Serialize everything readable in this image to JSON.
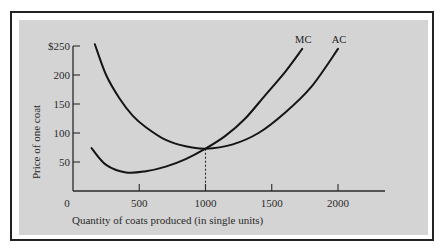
{
  "chart_data": {
    "type": "line",
    "title": "",
    "xlabel": "Quantity of coats produced (in single units)",
    "ylabel": "Price of one coat",
    "xlim": [
      0,
      2350
    ],
    "ylim": [
      0,
      250
    ],
    "x_ticks": [
      0,
      500,
      1000,
      1500,
      2000
    ],
    "x_tick_labels": [
      "0",
      "500",
      "1000",
      "1500",
      "2000"
    ],
    "y_ticks": [
      50,
      100,
      150,
      200,
      250
    ],
    "y_tick_labels": [
      "50",
      "100",
      "150",
      "200",
      "$250"
    ],
    "grid": false,
    "legend": "inline labels at curve ends",
    "series": [
      {
        "name": "MC",
        "x": [
          140,
          250,
          400,
          550,
          700,
          850,
          1000,
          1150,
          1300,
          1450,
          1600,
          1730
        ],
        "y": [
          74,
          45,
          32,
          34,
          42,
          55,
          73,
          95,
          125,
          165,
          205,
          245
        ]
      },
      {
        "name": "AC",
        "x": [
          165,
          250,
          350,
          450,
          550,
          700,
          850,
          1000,
          1200,
          1400,
          1600,
          1800,
          2000
        ],
        "y": [
          253,
          200,
          160,
          130,
          110,
          88,
          77,
          73,
          80,
          100,
          135,
          180,
          245
        ]
      }
    ],
    "annotations": [
      {
        "type": "dashed-vline",
        "x": 1000,
        "y_from": 0,
        "y_to": 73,
        "note": "MC crosses AC at minimum AC"
      }
    ]
  },
  "labels": {
    "mc": "MC",
    "ac": "AC",
    "x_title": "Quantity of coats produced (in single units)",
    "y_title": "Price of one coat"
  }
}
